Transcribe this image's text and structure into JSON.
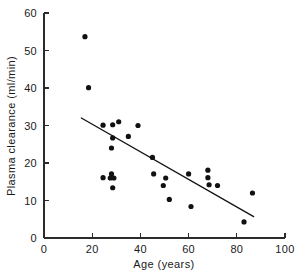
{
  "chart_data": {
    "type": "scatter",
    "title": "",
    "subtitle": "",
    "xlabel": "Age (years)",
    "ylabel": "Plasma clearance (ml/min)",
    "xlim": [
      0,
      100
    ],
    "ylim": [
      0,
      60
    ],
    "xticks": [
      0,
      20,
      40,
      60,
      80,
      100
    ],
    "yticks": [
      0,
      10,
      20,
      30,
      40,
      50,
      60
    ],
    "xtick_labels": [
      "0",
      "20",
      "40",
      "60",
      "80",
      "100"
    ],
    "ytick_labels": [
      "0",
      "10",
      "20",
      "30",
      "40",
      "50",
      "60"
    ],
    "grid": false,
    "legend": null,
    "legend_position": "none",
    "marker": "filled-circle",
    "marker_color": "#111111",
    "points": [
      {
        "x": 17,
        "y": 53.7
      },
      {
        "x": 18.5,
        "y": 40.1
      },
      {
        "x": 24.5,
        "y": 30.1
      },
      {
        "x": 28.5,
        "y": 30.2
      },
      {
        "x": 31,
        "y": 31.0
      },
      {
        "x": 39,
        "y": 30.0
      },
      {
        "x": 28.5,
        "y": 26.7
      },
      {
        "x": 35,
        "y": 27.1
      },
      {
        "x": 28,
        "y": 24.0
      },
      {
        "x": 45,
        "y": 21.5
      },
      {
        "x": 68,
        "y": 18.1
      },
      {
        "x": 45.5,
        "y": 17.1
      },
      {
        "x": 60,
        "y": 17.1
      },
      {
        "x": 28,
        "y": 17.1
      },
      {
        "x": 24.5,
        "y": 16.1
      },
      {
        "x": 27.5,
        "y": 16.0
      },
      {
        "x": 29,
        "y": 16.0
      },
      {
        "x": 50.5,
        "y": 16.0
      },
      {
        "x": 68,
        "y": 16.1
      },
      {
        "x": 49.5,
        "y": 14.0
      },
      {
        "x": 68.5,
        "y": 14.2
      },
      {
        "x": 72,
        "y": 14.0
      },
      {
        "x": 28.5,
        "y": 13.4
      },
      {
        "x": 86.5,
        "y": 12.0
      },
      {
        "x": 52,
        "y": 10.3
      },
      {
        "x": 61,
        "y": 8.4
      },
      {
        "x": 83,
        "y": 4.3
      }
    ],
    "fit_line": {
      "type": "linear-regression",
      "x_start": 15.5,
      "y_start": 32.0,
      "x_end": 87,
      "y_end": 5.7
    }
  },
  "axes": {
    "x_axis_name": "age-axis",
    "y_axis_name": "clearance-axis"
  }
}
